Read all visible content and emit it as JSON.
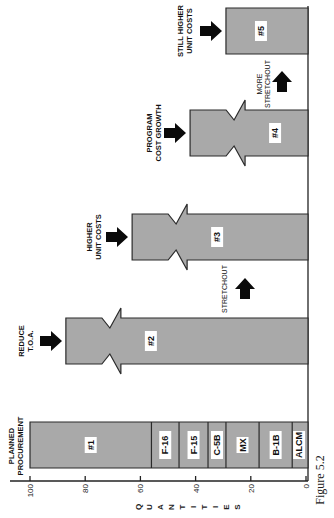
{
  "figure": {
    "caption": "Figure 5.2",
    "rotation_deg": -90
  },
  "colors": {
    "bar_fill": "#a9a9a9",
    "bar_stroke": "#2a2a2a",
    "arrow": "#0a0a0a",
    "label_box": "#ffffff"
  },
  "chart_data": {
    "type": "bar",
    "title": "",
    "xlabel": "",
    "ylabel": "QUANTITIES",
    "ylim": [
      0,
      100
    ],
    "yticks": [
      0,
      20,
      40,
      60,
      80,
      100
    ],
    "grid": false,
    "legend": null,
    "orientation_note": "Figure printed rotated 90 degrees counter-clockwise",
    "categories": [
      "#1",
      "#2",
      "#3",
      "#4",
      "#5"
    ],
    "values": [
      100,
      87,
      63,
      42,
      29
    ],
    "bar_annotations": [
      "PLANNED PROCUREMENT",
      "REDUCE T.O.A.",
      "HIGHER UNIT COSTS",
      "PROGRAM COST GROWTH",
      "STILL HIGHER UNIT COSTS"
    ],
    "between_bar_annotations": [
      {
        "between": [
          "#2",
          "#3"
        ],
        "label": "STRETCHOUT",
        "arrow": "up"
      },
      {
        "between": [
          "#4",
          "#5"
        ],
        "label": "MORE STRETCHOUT",
        "arrow": "up"
      }
    ],
    "broken_bars": [
      "#2",
      "#3",
      "#4"
    ],
    "stacked_segments_bar_1": [
      {
        "name": "#1",
        "from": 56,
        "to": 100,
        "value": 44
      },
      {
        "name": "F-16",
        "from": 46,
        "to": 56,
        "value": 10
      },
      {
        "name": "F-15",
        "from": 35.5,
        "to": 46,
        "value": 10.5
      },
      {
        "name": "C-5B",
        "from": 29,
        "to": 35.5,
        "value": 6.5
      },
      {
        "name": "MX",
        "from": 17,
        "to": 29,
        "value": 12
      },
      {
        "name": "B-1B",
        "from": 5,
        "to": 17,
        "value": 12
      },
      {
        "name": "ALCM",
        "from": 0,
        "to": 5,
        "value": 5
      }
    ]
  },
  "labels": {
    "axis_title": "QUANTITIES",
    "ticks": [
      "0",
      "20",
      "40",
      "60",
      "80",
      "100"
    ],
    "bar1": "#1",
    "bar2": "#2",
    "bar3": "#3",
    "bar4": "#4",
    "bar5": "#5",
    "seg_f16": "F-16",
    "seg_f15": "F-15",
    "seg_c5b": "C-5B",
    "seg_mx": "MX",
    "seg_b1b": "B-1B",
    "seg_alcm": "ALCM",
    "ann1_l1": "PLANNED",
    "ann1_l2": "PROCUREMENT",
    "ann2_l1": "REDUCE",
    "ann2_l2": "T.O.A.",
    "ann3_l1": "HIGHER",
    "ann3_l2": "UNIT COSTS",
    "ann4_l1": "PROGRAM",
    "ann4_l2": "COST GROWTH",
    "ann5_l1": "STILL HIGHER",
    "ann5_l2": "UNIT COSTS",
    "stretch1": "STRETCHOUT",
    "stretch2_l1": "MORE",
    "stretch2_l2": "STRETCHOUT"
  }
}
